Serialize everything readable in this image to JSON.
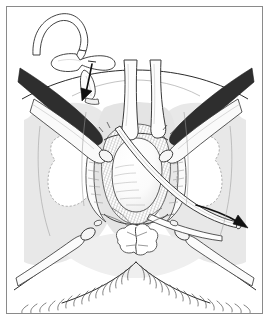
{
  "figure": {
    "domain": "medical-surgical-line-illustration",
    "title": "",
    "caption": "",
    "frame": {
      "border_color": "#8a8a8a",
      "background_color": "#ffffff",
      "inset_left": 6,
      "inset_top": 6,
      "width": 257,
      "height": 308
    },
    "palette": {
      "ink": "#1a1a1a",
      "line_mid": "#555555",
      "line_light": "#8c8c8c",
      "tissue_gray": "#e6e6e6",
      "tissue_gray_dark": "#d8d8d8",
      "hatch_gray": "#777777",
      "white": "#ffffff"
    },
    "parts": [
      {
        "id": "inset-t-tube",
        "name": "t-tube-catheter-inset",
        "label": "",
        "description": "Curved T-shaped tube drawn as a detached inset at upper left"
      },
      {
        "id": "arrow-insertion",
        "name": "insertion-arrow",
        "label": "",
        "description": "Short solid arrow pointing down-left toward the insertion site"
      },
      {
        "id": "arc-pubic",
        "name": "pubic-arc-line",
        "label": "",
        "description": "Wide arc spanning the upper field"
      },
      {
        "id": "retractor-left",
        "name": "retractor-upper-left",
        "label": "",
        "description": "Long instrument entering from upper left"
      },
      {
        "id": "retractor-right",
        "name": "retractor-upper-right",
        "label": "",
        "description": "Long instrument entering from upper right"
      },
      {
        "id": "retractor-lower-left",
        "name": "retractor-lower-left",
        "label": "",
        "description": "Instrument shaft angling to lower left"
      },
      {
        "id": "retractor-lower-right",
        "name": "retractor-lower-right",
        "label": "",
        "description": "Instrument shaft angling to lower right"
      },
      {
        "id": "blade-center",
        "name": "center-retractor-blade",
        "label": "",
        "description": "Pair of parallel vertical blades descending into the surgical field"
      },
      {
        "id": "cavity",
        "name": "surgical-cavity",
        "label": "",
        "description": "Central hatched opening with rounded structure"
      },
      {
        "id": "tube-exiting",
        "name": "drainage-tube",
        "label": "",
        "description": "Tube running diagonally out of the cavity to the lower right"
      },
      {
        "id": "arrow-direction",
        "name": "direction-arrow",
        "label": "",
        "description": "Solid arrow at lower right showing tube direction"
      },
      {
        "id": "labia-left",
        "name": "tissue-flap-left",
        "label": "",
        "description": "White dashed-outline tissue flap on the left"
      },
      {
        "id": "labia-right",
        "name": "tissue-flap-right",
        "label": "",
        "description": "White dashed-outline tissue flap on the right"
      },
      {
        "id": "anus",
        "name": "anal-verge",
        "label": "",
        "description": "Scalloped rosette structure at lower center"
      },
      {
        "id": "perineum-hatch",
        "name": "perineal-hatching",
        "label": "",
        "description": "Radiating hatch strokes along the lower thigh creases"
      }
    ]
  }
}
